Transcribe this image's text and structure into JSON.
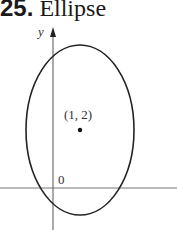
{
  "problem": {
    "number": "25.",
    "title": "Ellipse"
  },
  "figure": {
    "y_axis_label": "y",
    "origin_label": "0",
    "center_label": "(1, 2)",
    "shape": "ellipse",
    "center": [
      1,
      2
    ],
    "orientation": "vertical major axis"
  }
}
